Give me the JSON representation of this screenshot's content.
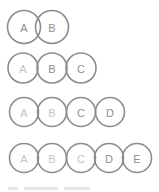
{
  "diagram": {
    "title": "",
    "style": {
      "stroke": "#8c8c8c",
      "label": "#8e8e8e",
      "label_faint": "#c4c4c4",
      "background": "#ffffff"
    },
    "rows": [
      {
        "cy": 27,
        "r": 16.5,
        "items": [
          {
            "label": "A",
            "cx": 24,
            "faint": false
          },
          {
            "label": "B",
            "cx": 52,
            "faint": false
          }
        ]
      },
      {
        "cy": 68,
        "r": 15,
        "items": [
          {
            "label": "A",
            "cx": 23,
            "faint": true
          },
          {
            "label": "B",
            "cx": 52,
            "faint": false
          },
          {
            "label": "C",
            "cx": 81,
            "faint": false
          }
        ]
      },
      {
        "cy": 112,
        "r": 14.5,
        "items": [
          {
            "label": "A",
            "cx": 24,
            "faint": true
          },
          {
            "label": "B",
            "cx": 52,
            "faint": true
          },
          {
            "label": "C",
            "cx": 81,
            "faint": false
          },
          {
            "label": "D",
            "cx": 110,
            "faint": false
          }
        ]
      },
      {
        "cy": 158,
        "r": 14.5,
        "items": [
          {
            "label": "A",
            "cx": 24,
            "faint": true
          },
          {
            "label": "B",
            "cx": 52,
            "faint": true
          },
          {
            "label": "C",
            "cx": 81,
            "faint": true
          },
          {
            "label": "D",
            "cx": 109,
            "faint": false
          },
          {
            "label": "E",
            "cx": 137,
            "faint": false
          }
        ]
      }
    ]
  }
}
